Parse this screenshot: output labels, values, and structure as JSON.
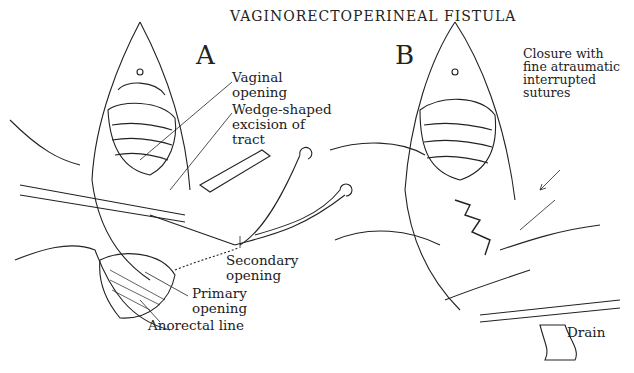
{
  "title": "VAGINORECTOPERINEAL FISTULA",
  "panels": [
    {
      "letter": "A",
      "labels": {
        "vaginal_opening_1": "Vaginal",
        "vaginal_opening_2": "opening",
        "wedge_1": "Wedge-shaped",
        "wedge_2": "excision of",
        "wedge_3": "tract",
        "secondary_1": "Secondary",
        "secondary_2": "opening",
        "primary_1": "Primary",
        "primary_2": "opening",
        "anorectal": "Anorectal line"
      }
    },
    {
      "letter": "B",
      "labels": {
        "closure_1": "Closure with",
        "closure_2": "fine atraumatic",
        "closure_3": "interrupted",
        "closure_4": "sutures",
        "drain": "Drain"
      }
    }
  ]
}
